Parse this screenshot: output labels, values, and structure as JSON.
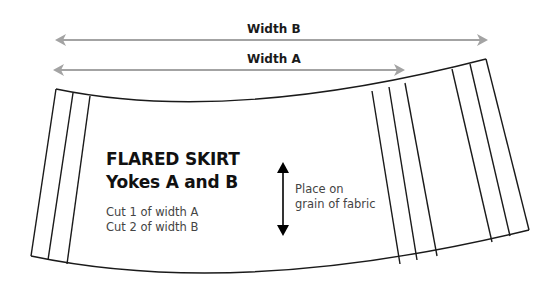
{
  "diagram": {
    "dimension_arrows": [
      {
        "label": "Width B",
        "color": "#a3a3a3"
      },
      {
        "label": "Width A",
        "color": "#a3a3a3"
      }
    ],
    "pattern_piece": {
      "title_line1": "FLARED SKIRT",
      "title_line2": "Yokes A and B",
      "instructions": [
        "Cut 1 of width A",
        "Cut 2 of width B"
      ],
      "outline_color": "#1a1a1a"
    },
    "grain_indicator": {
      "label_line1": "Place on",
      "label_line2": "grain of fabric"
    }
  }
}
